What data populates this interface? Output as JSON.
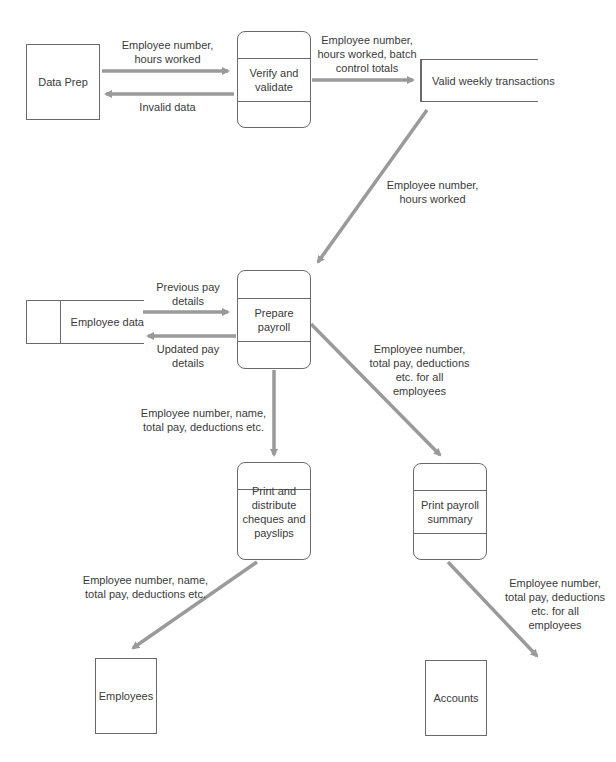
{
  "diagram": {
    "type": "data-flow-diagram",
    "colors": {
      "line": "#6a6a6a",
      "arrow": "#9a9a9a",
      "text": "#3a3a3a"
    },
    "entities": {
      "data_prep": "Data Prep",
      "employees": "Employees",
      "accounts": "Accounts"
    },
    "processes": {
      "verify": "Verify and validate",
      "prepare": "Prepare payroll",
      "print_distribute": "Print and distribute cheques and payslips",
      "print_summary": "Print payroll summary"
    },
    "stores": {
      "valid_weekly": "Valid weekly transactions",
      "employee_data": "Employee data"
    },
    "flows": {
      "dataprep_to_verify": "Employee number,\nhours worked",
      "verify_to_dataprep": "Invalid data",
      "verify_to_store": "Employee number,\nhours worked, batch\ncontrol totals",
      "store_to_prepare": "Employee number,\nhours worked",
      "empdata_to_prepare": "Previous pay\ndetails",
      "prepare_to_empdata": "Updated pay\ndetails",
      "prepare_to_print": "Employee number, name,\ntotal pay, deductions etc.",
      "prepare_to_summary": "Employee number,\ntotal pay, deductions\netc. for all\nemployees",
      "print_to_employees": "Employee number, name,\ntotal pay, deductions etc.",
      "summary_to_accounts": "Employee number,\ntotal pay, deductions\netc. for all\nemployees"
    }
  }
}
